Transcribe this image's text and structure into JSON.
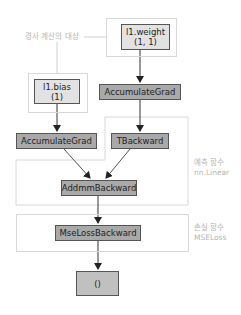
{
  "diagram": {
    "type": "autograd-computation-graph",
    "colors": {
      "leaf_node": "#e2e2e2",
      "op_node": "#a9a9a9",
      "group_border": "#d8d8d8",
      "annotation_text": "#b5b5b5",
      "edge": "#333333"
    },
    "nodes": {
      "weight": {
        "line1": "l1.weight",
        "line2": "(1, 1)"
      },
      "bias": {
        "line1": "l1.bias",
        "line2": "(1)"
      },
      "acc_grad_weight": {
        "label": "AccumulateGrad"
      },
      "acc_grad_bias": {
        "label": "AccumulateGrad"
      },
      "tbackward": {
        "label": "TBackward"
      },
      "addmm": {
        "label": "AddmmBackward"
      },
      "mseloss": {
        "label": "MseLossBackward"
      },
      "output": {
        "label": "()"
      }
    },
    "annotations": {
      "grad_target": "경사 계산의 대상",
      "prediction_fn": {
        "line1": "예측 함수",
        "line2": "nn.Linear"
      },
      "loss_fn": {
        "line1": "손실 함수",
        "line2": "MSELoss"
      }
    },
    "edges": [
      [
        "weight",
        "acc_grad_weight"
      ],
      [
        "acc_grad_weight",
        "tbackward"
      ],
      [
        "bias",
        "acc_grad_bias"
      ],
      [
        "acc_grad_bias",
        "addmm"
      ],
      [
        "tbackward",
        "addmm"
      ],
      [
        "addmm",
        "mseloss"
      ],
      [
        "mseloss",
        "output"
      ]
    ]
  }
}
